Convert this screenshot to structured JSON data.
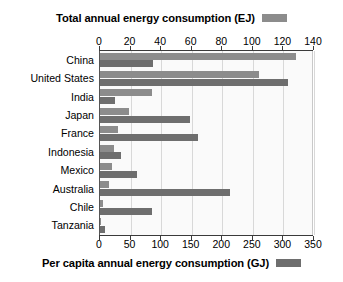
{
  "top_legend": {
    "title": "Total annual energy consumption (EJ)",
    "swatch_color": "#8c8c8c",
    "swatch_name": "total-energy-legend-swatch"
  },
  "bottom_legend": {
    "title": "Per capita annual energy consumption (GJ)",
    "swatch_color": "#6e6e6e",
    "swatch_name": "per-capita-legend-swatch"
  },
  "top_axis": {
    "ticks": [
      "0",
      "20",
      "40",
      "60",
      "80",
      "100",
      "120",
      "140"
    ],
    "min": 0,
    "max": 140,
    "step": 20
  },
  "bottom_axis": {
    "ticks": [
      "0",
      "50",
      "100",
      "150",
      "200",
      "250",
      "300",
      "350"
    ],
    "min": 0,
    "max": 350,
    "step": 50
  },
  "chart_data": {
    "type": "bar",
    "orientation": "horizontal",
    "title": "Total annual energy consumption (EJ)",
    "subtitle": "Per capita annual energy consumption (GJ)",
    "xlabel": "",
    "ylabel": "",
    "grid": true,
    "legend_position": "top-right and bottom-right",
    "categories": [
      "China",
      "United States",
      "India",
      "Japan",
      "France",
      "Indonesia",
      "Mexico",
      "Australia",
      "Chile",
      "Tanzania"
    ],
    "series": [
      {
        "name": "Total annual energy consumption (EJ)",
        "axis": "top",
        "unit": "EJ",
        "color": "#8c8c8c",
        "xlim": [
          0,
          140
        ],
        "values": [
          128,
          104,
          34,
          19,
          12,
          9,
          8,
          6,
          2,
          0.5
        ]
      },
      {
        "name": "Per capita annual energy consumption (GJ)",
        "axis": "bottom",
        "unit": "GJ",
        "color": "#6e6e6e",
        "xlim": [
          0,
          350
        ],
        "values": [
          87,
          307,
          24,
          147,
          160,
          34,
          60,
          212,
          85,
          8
        ]
      }
    ]
  }
}
